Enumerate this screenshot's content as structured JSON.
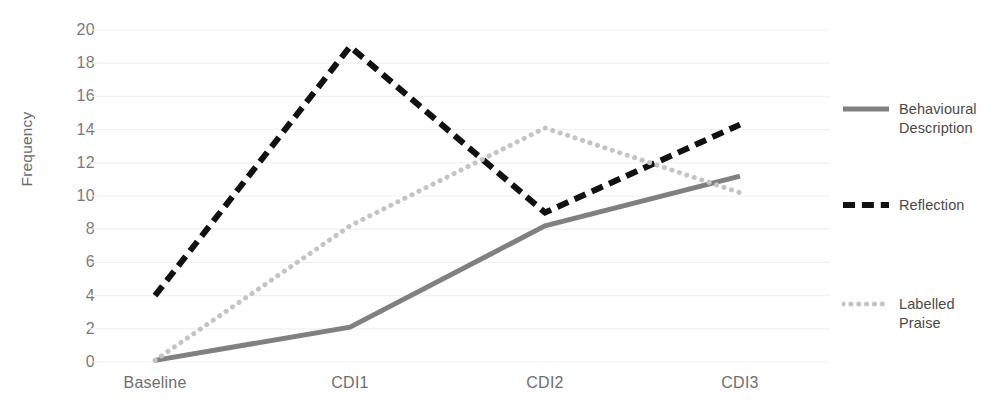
{
  "chart_data": {
    "type": "line",
    "title": "",
    "xlabel": "",
    "ylabel": "Frequency",
    "categories": [
      "Baseline",
      "CDI1",
      "CDI2",
      "CDI3"
    ],
    "ylim": [
      0,
      20
    ],
    "ytick_step": 2,
    "yticks": [
      20,
      18,
      16,
      14,
      12,
      10,
      8,
      6,
      4,
      2,
      0
    ],
    "grid": "horizontal",
    "legend_position": "right",
    "series": [
      {
        "name": "Behavioural Description",
        "values": [
          0.1,
          2.1,
          8.2,
          11.2
        ],
        "color": "#808080",
        "style": "solid",
        "width": 5
      },
      {
        "name": "Reflection",
        "values": [
          4,
          19,
          9,
          14.3
        ],
        "color": "#111111",
        "style": "dashed",
        "width": 6
      },
      {
        "name": "Labelled Praise",
        "values": [
          0.1,
          8.2,
          14.1,
          10.2
        ],
        "color": "#c4c4c4",
        "style": "dotted",
        "width": 5
      }
    ]
  },
  "legend": {
    "items": [
      {
        "label": "Behavioural Description"
      },
      {
        "label": "Reflection"
      },
      {
        "label": "Labelled Praise"
      }
    ]
  },
  "axis": {
    "y_label": "Frequency"
  }
}
